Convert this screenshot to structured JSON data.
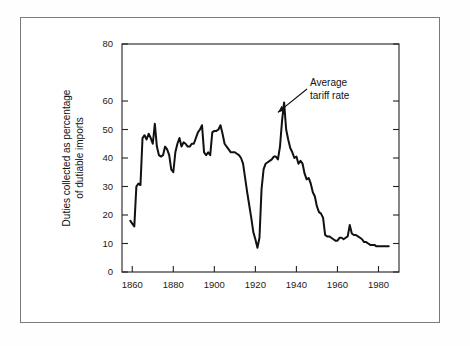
{
  "figure": {
    "background_color": "#ffffff",
    "frame_color": "#7a7a7a",
    "line_color": "#111111"
  },
  "chart_data": {
    "type": "line",
    "title": "",
    "xlabel": "",
    "ylabel": "Duties collected as percentage of dutiable imports",
    "ylabel_line1": "Duties collected as percentage",
    "ylabel_line2": "of dutiable imports",
    "xlim": [
      1855,
      1990
    ],
    "ylim": [
      0,
      80
    ],
    "grid": false,
    "legend": "none",
    "x_ticks": [
      1860,
      1880,
      1900,
      1920,
      1940,
      1960,
      1980
    ],
    "x_tick_labels": [
      "1860",
      "1880",
      "1900",
      "1920",
      "1940",
      "1960",
      "1980"
    ],
    "y_ticks": [
      0,
      10,
      20,
      30,
      40,
      50,
      60,
      80
    ],
    "y_tick_labels": [
      "0",
      "10",
      "20",
      "30",
      "40",
      "50",
      "60",
      "80"
    ],
    "annotations": [
      {
        "text_line1": "Average",
        "text_line2": "tariff rate",
        "text": "Average tariff rate",
        "points_to_year": 1931,
        "points_to_value": 56
      }
    ],
    "series": [
      {
        "name": "Average tariff rate",
        "x": [
          1859,
          1860,
          1861,
          1862,
          1863,
          1864,
          1865,
          1866,
          1867,
          1868,
          1869,
          1870,
          1871,
          1872,
          1873,
          1874,
          1875,
          1876,
          1877,
          1878,
          1879,
          1880,
          1881,
          1882,
          1883,
          1884,
          1885,
          1886,
          1887,
          1888,
          1889,
          1890,
          1891,
          1892,
          1893,
          1894,
          1895,
          1896,
          1897,
          1898,
          1899,
          1900,
          1901,
          1902,
          1903,
          1904,
          1905,
          1906,
          1907,
          1908,
          1909,
          1910,
          1911,
          1912,
          1913,
          1914,
          1915,
          1916,
          1917,
          1918,
          1919,
          1920,
          1921,
          1922,
          1923,
          1924,
          1925,
          1926,
          1927,
          1928,
          1929,
          1930,
          1931,
          1932,
          1933,
          1934,
          1935,
          1936,
          1937,
          1938,
          1939,
          1940,
          1941,
          1942,
          1943,
          1944,
          1945,
          1946,
          1947,
          1948,
          1949,
          1950,
          1951,
          1952,
          1953,
          1954,
          1955,
          1956,
          1957,
          1958,
          1959,
          1960,
          1961,
          1962,
          1963,
          1964,
          1965,
          1966,
          1967,
          1968,
          1969,
          1970,
          1971,
          1972,
          1973,
          1974,
          1975,
          1976,
          1977,
          1978,
          1979,
          1980,
          1981,
          1982,
          1983,
          1984,
          1985
        ],
        "values": [
          18.0,
          17.0,
          16.0,
          30.0,
          31.0,
          30.5,
          47.0,
          48.0,
          46.5,
          48.5,
          47.0,
          45.0,
          52.0,
          44.0,
          41.0,
          40.5,
          41.0,
          44.0,
          43.0,
          41.0,
          36.0,
          35.0,
          42.0,
          45.0,
          47.0,
          44.0,
          45.5,
          45.0,
          44.0,
          44.0,
          45.0,
          45.0,
          47.0,
          49.0,
          50.0,
          51.5,
          42.0,
          41.0,
          42.0,
          41.0,
          49.0,
          49.5,
          49.5,
          50.0,
          51.5,
          48.5,
          45.0,
          44.0,
          43.0,
          42.0,
          42.0,
          42.0,
          41.5,
          41.0,
          40.0,
          38.0,
          33.0,
          28.0,
          23.5,
          19.0,
          14.0,
          11.5,
          8.5,
          12.0,
          29.0,
          36.0,
          38.0,
          38.5,
          39.0,
          39.5,
          40.5,
          40.5,
          39.5,
          44.0,
          53.0,
          59.5,
          50.0,
          46.5,
          43.5,
          42.0,
          40.0,
          40.5,
          38.0,
          39.0,
          38.0,
          34.5,
          32.5,
          33.0,
          31.0,
          28.0,
          26.5,
          23.0,
          21.0,
          20.5,
          19.0,
          13.0,
          12.5,
          12.5,
          12.0,
          11.5,
          11.0,
          11.0,
          12.0,
          12.0,
          11.5,
          12.0,
          12.5,
          16.5,
          13.5,
          13.0,
          13.0,
          12.5,
          12.0,
          11.5,
          10.5,
          10.5,
          10.0,
          9.5,
          9.5,
          9.5,
          9.0,
          9.0,
          9.0,
          9.0,
          9.0,
          9.0,
          9.0
        ]
      }
    ]
  }
}
